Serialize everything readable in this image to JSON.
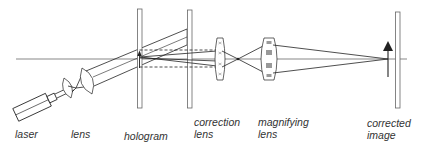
{
  "diagram": {
    "line_color": "#222222",
    "plate_color": "#666666",
    "components": [
      {
        "id": "laser",
        "label_lines": [
          "laser"
        ]
      },
      {
        "id": "lens",
        "label_lines": [
          "lens"
        ]
      },
      {
        "id": "hologram",
        "label_lines": [
          "hologram"
        ]
      },
      {
        "id": "correction-lens",
        "label_lines": [
          "correction",
          "lens"
        ]
      },
      {
        "id": "magnifying-lens",
        "label_lines": [
          "magnifying",
          "lens"
        ]
      },
      {
        "id": "corrected-image",
        "label_lines": [
          "corrected",
          "image"
        ]
      }
    ]
  }
}
